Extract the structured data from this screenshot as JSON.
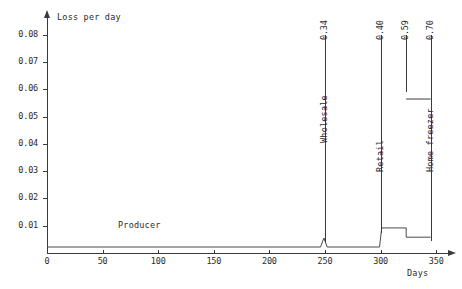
{
  "chart_data": {
    "type": "line",
    "title": "",
    "xlabel": "Days",
    "ylabel": "Loss per day",
    "xlim": [
      0,
      357
    ],
    "ylim": [
      0,
      0.0855
    ],
    "grid": false,
    "legend": null,
    "x_ticks": [
      0,
      50,
      100,
      150,
      200,
      250,
      300,
      350
    ],
    "x_tick_labels": [
      "0",
      "50",
      "100",
      "150",
      "200",
      "250",
      "300",
      "350"
    ],
    "y_ticks": [
      0.01,
      0.02,
      0.03,
      0.04,
      0.05,
      0.06,
      0.07,
      0.08
    ],
    "y_tick_labels": [
      "0.01",
      "0.02",
      "0.03",
      "0.04",
      "0.05",
      "0.06",
      "0.07",
      "0.08"
    ],
    "series": [
      {
        "name": "Producer",
        "label": "Producer",
        "points": [
          {
            "x": 0,
            "y": 0.0022
          },
          {
            "x": 246,
            "y": 0.0022
          },
          {
            "x": 249,
            "y": 0.0055
          },
          {
            "x": 252,
            "y": 0.0022
          },
          {
            "x": 299,
            "y": 0.0022
          },
          {
            "x": 301,
            "y": 0.0092
          },
          {
            "x": 323,
            "y": 0.0092
          },
          {
            "x": 323,
            "y": 0.0058
          },
          {
            "x": 345,
            "y": 0.0058
          }
        ]
      }
    ],
    "annotations": [
      {
        "id": "wholesale",
        "x": 250,
        "value": "0.34",
        "name": "Wholesale",
        "rule_top": 0.08,
        "rule_bottom": 0.0035,
        "name_y": 0.0435
      },
      {
        "id": "retail",
        "x": 300,
        "value": "0.40",
        "name": "Retail",
        "rule_top": 0.08,
        "rule_bottom": 0.0075,
        "name_y": 0.033
      },
      {
        "id": "unnamed-059",
        "x": 323,
        "value": "0.59",
        "name": "",
        "rule_top": 0.08,
        "rule_bottom": 0.059,
        "name_y": null
      },
      {
        "id": "home-freezer",
        "x": 345,
        "value": "0.70",
        "name": "Home freezer",
        "rule_top": 0.08,
        "rule_bottom": 0.0045,
        "name_y": 0.033
      }
    ],
    "annotation_bracket": {
      "from_x": 323,
      "to_x": 345,
      "y": 0.0565
    }
  },
  "colors": {
    "axis": "#3a3a3a",
    "series": "#4a4a4a",
    "text": "#2b2b2b",
    "background": "#ffffff"
  }
}
